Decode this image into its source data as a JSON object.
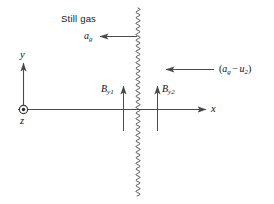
{
  "figure": {
    "title_text": "Still gas",
    "background_color": "#ffffff",
    "line_color": "#4a4a4a",
    "text_color": "#111111",
    "width": 274,
    "height": 204
  },
  "axes": {
    "x_label": "x",
    "y_label": "y",
    "z_label": "z",
    "origin_marker": "circle-dot-out-of-page"
  },
  "annotations": {
    "still_gas": "Still gas",
    "gas_velocity": {
      "symbol": "a",
      "subscript": "g"
    },
    "relative_velocity": {
      "open": "(",
      "first_symbol": "a",
      "first_subscript": "g",
      "operator": "−",
      "second_symbol": "u",
      "second_subscript": "2",
      "close": ")"
    },
    "b_y1": {
      "symbol": "B",
      "subscript": "y1"
    },
    "b_y2": {
      "symbol": "B",
      "subscript": "y2"
    }
  },
  "elements": {
    "wavy_interface_name": "wavy-interface-line",
    "gas_arrow_name": "gas-velocity-arrow",
    "relative_arrow_name": "relative-velocity-arrow",
    "by1_arrow_name": "by1-vector-arrow",
    "by2_arrow_name": "by2-vector-arrow"
  }
}
